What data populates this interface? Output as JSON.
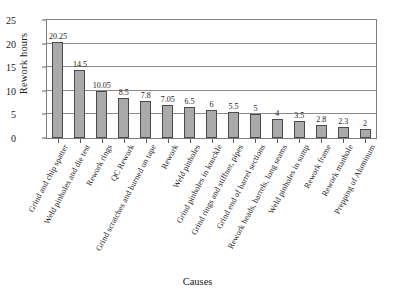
{
  "chart_data": {
    "type": "bar",
    "title": "",
    "xlabel": "Causes",
    "ylabel": "Rework hours",
    "ylim": [
      0,
      25
    ],
    "yticks": [
      0,
      5,
      10,
      15,
      20,
      25
    ],
    "grid": true,
    "legend": false,
    "bar_color": "#aaaaaa",
    "bar_edge_color": "#4a4a4a",
    "categories": [
      "Grind and chip spatter",
      "Weld pinholes and die test",
      "Rework rings",
      "QC Rework",
      "Grind scratches and burned on tape",
      "Rework",
      "Weld pinholes",
      "Grind pinholes in knuckle",
      "Grind rings and stiffner, pipes",
      "Grind end of barrel sections",
      "Rework heads, barrels, long seams",
      "Weld pinholes in sump",
      "Rework frame",
      "Rework manhole",
      "Prepping of Aluminum"
    ],
    "values": [
      20.25,
      14.5,
      10.05,
      8.5,
      7.8,
      7.05,
      6.5,
      6,
      5.5,
      5,
      4,
      3.5,
      2.8,
      2.3,
      2
    ],
    "value_labels": [
      "20.25",
      "14.5",
      "10.05",
      "8.5",
      "7.8",
      "7.05",
      "6.5",
      "6",
      "5.5",
      "5",
      "4",
      "3.5",
      "2.8",
      "2.3",
      "2"
    ]
  }
}
